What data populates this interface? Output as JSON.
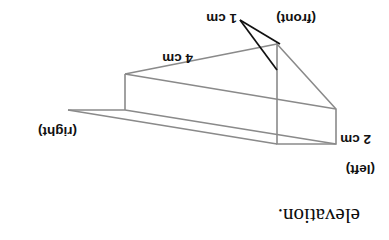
{
  "figure": {
    "kind": "cuboid-isometric-drawing",
    "caption": "elevation.",
    "line_color": "#8a8a8a",
    "leader_color": "#111111",
    "background_color": "#ffffff",
    "orientation_note": "180-degree rotated",
    "dimensions": {
      "depth": "1 cm",
      "height": "2 cm",
      "length": "4 cm"
    },
    "face_labels": {
      "front": "(front)",
      "left": "(left)",
      "right": "(right)"
    }
  }
}
